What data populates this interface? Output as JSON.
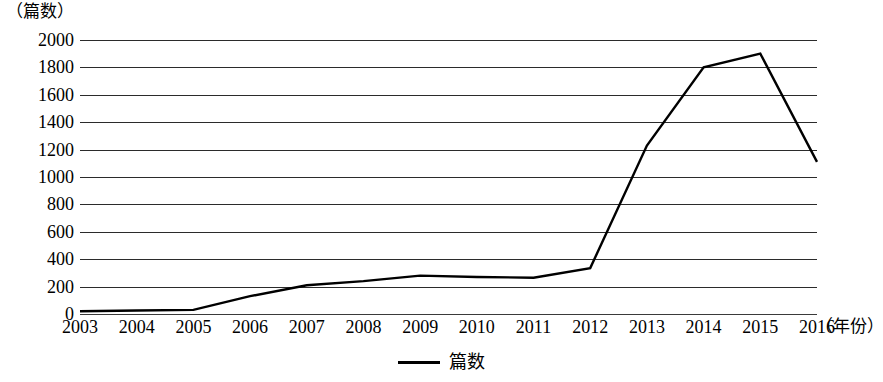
{
  "chart_data": {
    "type": "line",
    "title": "",
    "subtitle": "",
    "xlabel": "（年份）",
    "ylabel": "（篇数）",
    "categories": [
      "2003",
      "2004",
      "2005",
      "2006",
      "2007",
      "2008",
      "2009",
      "2010",
      "2011",
      "2012",
      "2013",
      "2014",
      "2015",
      "2016"
    ],
    "series": [
      {
        "name": "篇数",
        "values": [
          20,
          25,
          30,
          130,
          210,
          240,
          280,
          270,
          265,
          335,
          1230,
          1800,
          1900,
          1110
        ]
      }
    ],
    "ylim": [
      0,
      2000
    ],
    "ytick_labels": [
      "2000",
      "1800",
      "1600",
      "1400",
      "1200",
      "1000",
      "800",
      "600",
      "400",
      "200",
      "0"
    ],
    "ytick_values": [
      2000,
      1800,
      1600,
      1400,
      1200,
      1000,
      800,
      600,
      400,
      200,
      0
    ],
    "ytick_step": 200,
    "grid": true,
    "grid_axis": "y",
    "legend": [
      {
        "label": "篇数",
        "marker": "line",
        "color": "#000000"
      }
    ],
    "legend_position": "bottom-center",
    "line_color": "#000000",
    "grid_color": "#2b2b2b",
    "background_color": "#ffffff"
  }
}
